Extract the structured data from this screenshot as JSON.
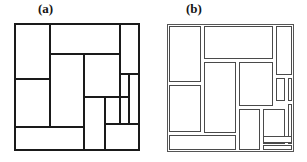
{
  "figure": {
    "title": "",
    "background_color": "#ffffff",
    "width": 307,
    "height": 162,
    "panels": [
      {
        "id": "a",
        "label": "(a)",
        "style": "thick-shared-edges",
        "line_color": "#1a1a1a",
        "line_width": 2.1,
        "fill_color": "#ffffff",
        "frame": {
          "x": 0,
          "y": 0,
          "width": 124,
          "height": 126
        },
        "block_count": 13,
        "blocks": [
          {
            "name": "a-r1",
            "x": 0,
            "y": 0,
            "width": 35,
            "height": 55
          },
          {
            "name": "a-r2",
            "x": 35,
            "y": 0,
            "width": 70,
            "height": 30
          },
          {
            "name": "a-r3",
            "x": 105,
            "y": 0,
            "width": 19,
            "height": 50
          },
          {
            "name": "a-r4",
            "x": 35,
            "y": 30,
            "width": 34,
            "height": 73
          },
          {
            "name": "a-r5",
            "x": 69,
            "y": 30,
            "width": 36,
            "height": 43
          },
          {
            "name": "a-r6",
            "x": 0,
            "y": 55,
            "width": 35,
            "height": 48
          },
          {
            "name": "a-r7",
            "x": 105,
            "y": 50,
            "width": 9,
            "height": 23
          },
          {
            "name": "a-r8",
            "x": 114,
            "y": 50,
            "width": 10,
            "height": 50
          },
          {
            "name": "a-r9",
            "x": 69,
            "y": 73,
            "width": 21,
            "height": 53
          },
          {
            "name": "a-r10",
            "x": 90,
            "y": 73,
            "width": 24,
            "height": 47
          },
          {
            "name": "a-r11",
            "x": 0,
            "y": 103,
            "width": 69,
            "height": 23
          },
          {
            "name": "a-r12",
            "x": 90,
            "y": 100,
            "width": 34,
            "height": 26
          },
          {
            "name": "a-r13",
            "x": 105,
            "y": 73,
            "width": 9,
            "height": 27
          }
        ]
      },
      {
        "id": "b",
        "label": "(b)",
        "style": "thin-lines-with-gaps",
        "line_color": "#4a4a4a",
        "line_width": 1.0,
        "fill_color": "#ffffff",
        "gap": 2,
        "frame": {
          "x": 0,
          "y": 0,
          "width": 126,
          "height": 127
        },
        "block_count": 14,
        "blocks": [
          {
            "name": "b-r1",
            "x": 2,
            "y": 2,
            "width": 31,
            "height": 55
          },
          {
            "name": "b-r2",
            "x": 37,
            "y": 2,
            "width": 68,
            "height": 32
          },
          {
            "name": "b-r3",
            "x": 109,
            "y": 2,
            "width": 15,
            "height": 48
          },
          {
            "name": "b-r4",
            "x": 37,
            "y": 38,
            "width": 31,
            "height": 70
          },
          {
            "name": "b-r5",
            "x": 72,
            "y": 38,
            "width": 33,
            "height": 43
          },
          {
            "name": "b-r6",
            "x": 2,
            "y": 61,
            "width": 31,
            "height": 46
          },
          {
            "name": "b-r7",
            "x": 109,
            "y": 54,
            "width": 8,
            "height": 22
          },
          {
            "name": "b-r8",
            "x": 121,
            "y": 54,
            "width": 3,
            "height": 22
          },
          {
            "name": "b-r9",
            "x": 72,
            "y": 85,
            "width": 20,
            "height": 40
          },
          {
            "name": "b-r10",
            "x": 96,
            "y": 85,
            "width": 21,
            "height": 34
          },
          {
            "name": "b-r11",
            "x": 121,
            "y": 80,
            "width": 3,
            "height": 39
          },
          {
            "name": "b-r12",
            "x": 2,
            "y": 111,
            "width": 66,
            "height": 14
          },
          {
            "name": "b-r13",
            "x": 96,
            "y": 112,
            "width": 28,
            "height": 6
          },
          {
            "name": "b-r14",
            "x": 96,
            "y": 121,
            "width": 28,
            "height": 4
          }
        ]
      }
    ]
  }
}
